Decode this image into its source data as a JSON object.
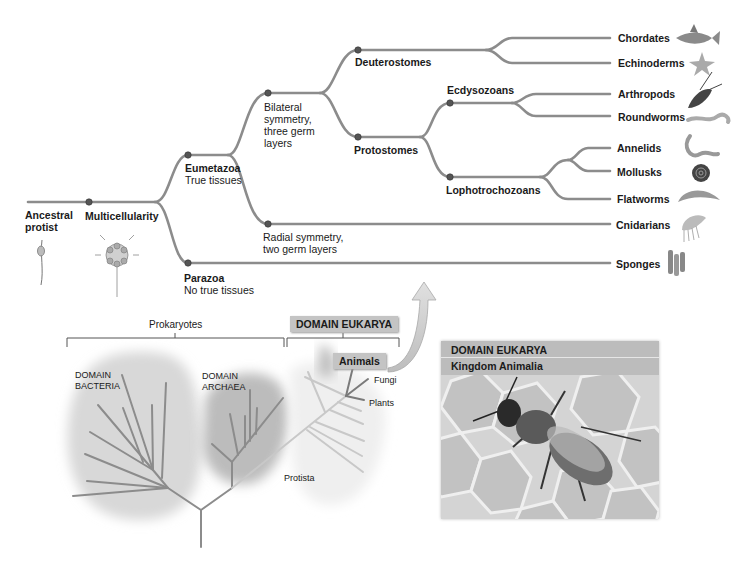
{
  "tree": {
    "root": {
      "label_line1": "Ancestral",
      "label_line2": "protist"
    },
    "nodes": {
      "multicellularity": "Multicellularity",
      "eumetazoa": {
        "title": "Eumetazoa",
        "subtitle": "True tissues"
      },
      "parazoa": {
        "title": "Parazoa",
        "subtitle": "No true tissues"
      },
      "bilateral": {
        "line1": "Bilateral",
        "line2": "symmetry,",
        "line3": "three germ",
        "line4": "layers"
      },
      "radial": {
        "line1": "Radial symmetry,",
        "line2": "two germ layers"
      },
      "deuterostomes": "Deuterostomes",
      "protostomes": "Protostomes",
      "ecdysozoans": "Ecdysozoans",
      "lophotrochozoans": "Lophotrochozoans"
    },
    "taxa": [
      {
        "name": "Chordates",
        "icon": "fish-icon"
      },
      {
        "name": "Echinoderms",
        "icon": "sea-star-icon"
      },
      {
        "name": "Arthropods",
        "icon": "lobster-icon"
      },
      {
        "name": "Roundworms",
        "icon": "roundworm-icon"
      },
      {
        "name": "Annelids",
        "icon": "earthworm-icon"
      },
      {
        "name": "Mollusks",
        "icon": "snail-icon"
      },
      {
        "name": "Flatworms",
        "icon": "flatworm-icon"
      },
      {
        "name": "Cnidarians",
        "icon": "jellyfish-icon"
      },
      {
        "name": "Sponges",
        "icon": "sponge-icon"
      }
    ]
  },
  "domains": {
    "prokaryotes": "Prokaryotes",
    "bacteria": {
      "line1": "DOMAIN",
      "line2": "BACTERIA"
    },
    "archaea": {
      "line1": "DOMAIN",
      "line2": "ARCHAEA"
    },
    "eukarya": "DOMAIN EUKARYA",
    "animals": "Animals",
    "fungi": "Fungi",
    "plants": "Plants",
    "protista": "Protista"
  },
  "photo_panel": {
    "domain": "DOMAIN EUKARYA",
    "kingdom": "Kingdom Animalia",
    "subject": "honeybee-on-honeycomb"
  },
  "colors": {
    "branch": "#8c8c8c",
    "node": "#555555",
    "bacteria_blob": "#d6d6d6",
    "archaea_blob": "#bdbdbd",
    "eukarya_branch": "#c8c8c8",
    "label_box": "#c4c4c4"
  }
}
